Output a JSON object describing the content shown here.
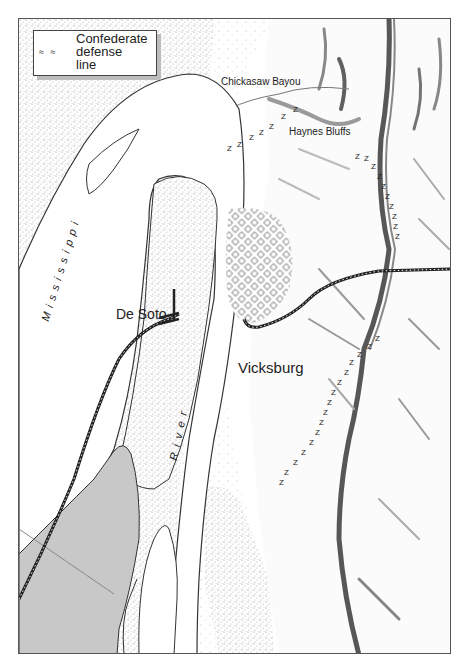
{
  "legend": {
    "symbol": "≈ ≈",
    "icon": "defense-line-icon",
    "text": "Confederate\ndefense\nline"
  },
  "labels": {
    "chickasaw_bayou": "Chickasaw Bayou",
    "haynes_bluffs": "Haynes Bluffs",
    "de_soto": "De Soto",
    "vicksburg": "Vicksburg",
    "mississippi": "Mississippi",
    "river": "River"
  },
  "map_features": {
    "rivers": [
      "Mississippi River"
    ],
    "railroads": [
      "De Soto rail line",
      "Vicksburg rail line"
    ],
    "settlements": [
      "De Soto",
      "Vicksburg"
    ],
    "terrain": [
      "Bluffs ridge",
      "Floodplain stipple"
    ],
    "defense_line_glyph": "Z"
  },
  "colors": {
    "frame": "#555555",
    "river_outline": "#333333",
    "stipple": "#9a9a9a",
    "shaded_area": "#c8c8c8",
    "ridge_shadow": "#3a3a3a",
    "text": "#222222"
  }
}
